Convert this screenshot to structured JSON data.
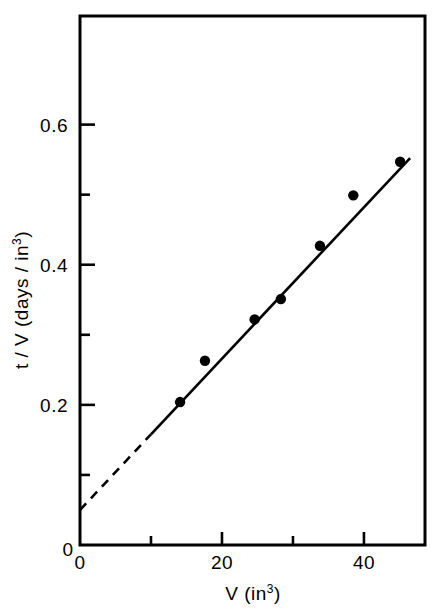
{
  "chart_data": {
    "type": "scatter",
    "title": "",
    "subtitle": "",
    "xlabel": "V (in³)",
    "ylabel": "t / V (days / in³)",
    "xlabel_base": "V (in",
    "xlabel_exp": "3",
    "xlabel_close": ")",
    "ylabel_base": "t / V (days / in",
    "ylabel_exp": "3",
    "ylabel_close": ")",
    "xlim": [
      0,
      48.6
    ],
    "ylim": [
      0,
      0.755
    ],
    "grid": false,
    "legend": "none",
    "x_ticks_major": [
      0,
      20,
      40
    ],
    "x_ticks_major_labels": [
      "0",
      "20",
      "40"
    ],
    "x_ticks_minor": [
      10,
      30
    ],
    "y_ticks_major": [
      0,
      0.2,
      0.4,
      0.6
    ],
    "y_ticks_major_labels": [
      "0",
      "0.2",
      "0.4",
      "0.6"
    ],
    "y_ticks_minor": [
      0.1,
      0.3,
      0.5
    ],
    "origin_label": "0",
    "series": [
      {
        "name": "measurements",
        "marker": "filled-circle",
        "marker_color": "#000000",
        "x": [
          14.1,
          17.6,
          24.6,
          28.3,
          33.8,
          38.5,
          45.1
        ],
        "y": [
          0.204,
          0.263,
          0.322,
          0.351,
          0.427,
          0.499,
          0.547
        ]
      }
    ],
    "fit_line": {
      "name": "linear fit",
      "intercept": 0.05,
      "slope": 0.0108,
      "solid_x_range": [
        10.0,
        46.5
      ],
      "dashed_x_range": [
        0.0,
        10.0
      ],
      "dashed_note": "extrapolation to intercept",
      "color": "#000000"
    }
  },
  "figure": {
    "background_color": "#ffffff",
    "axis_color": "#000000"
  }
}
